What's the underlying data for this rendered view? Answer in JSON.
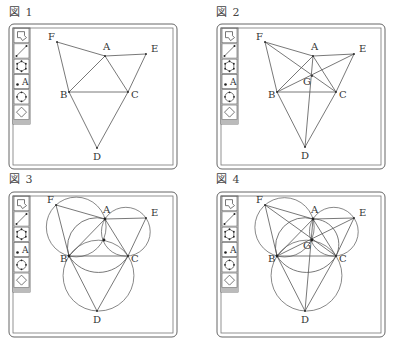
{
  "figures": [
    {
      "caption": "図 1",
      "points": {
        "F": [
          57,
          42
        ],
        "A": [
          105,
          56
        ],
        "E": [
          146,
          54
        ],
        "B": [
          69,
          92
        ],
        "C": [
          128,
          92
        ],
        "D": [
          97,
          148
        ]
      },
      "labels": [
        "F",
        "A",
        "E",
        "B",
        "C",
        "D"
      ],
      "segments": [
        [
          "F",
          "A"
        ],
        [
          "A",
          "E"
        ],
        [
          "F",
          "B"
        ],
        [
          "E",
          "C"
        ],
        [
          "A",
          "B"
        ],
        [
          "A",
          "C"
        ],
        [
          "B",
          "C"
        ],
        [
          "B",
          "D"
        ],
        [
          "C",
          "D"
        ]
      ],
      "circles": []
    },
    {
      "caption": "図 2",
      "points": {
        "F": [
          57,
          42
        ],
        "A": [
          105,
          56
        ],
        "E": [
          146,
          54
        ],
        "B": [
          69,
          92
        ],
        "C": [
          128,
          92
        ],
        "D": [
          97,
          147
        ],
        "G": [
          104,
          76
        ]
      },
      "labels": [
        "F",
        "A",
        "E",
        "B",
        "C",
        "D",
        "G"
      ],
      "segments": [
        [
          "F",
          "A"
        ],
        [
          "A",
          "E"
        ],
        [
          "F",
          "B"
        ],
        [
          "E",
          "C"
        ],
        [
          "A",
          "B"
        ],
        [
          "A",
          "C"
        ],
        [
          "B",
          "C"
        ],
        [
          "B",
          "D"
        ],
        [
          "C",
          "D"
        ],
        [
          "F",
          "C"
        ],
        [
          "E",
          "B"
        ],
        [
          "A",
          "D"
        ]
      ],
      "circles": []
    },
    {
      "caption": "図 3",
      "points": {
        "F": [
          56,
          37
        ],
        "A": [
          105,
          51
        ],
        "E": [
          146,
          50
        ],
        "B": [
          69,
          88
        ],
        "C": [
          128,
          88
        ],
        "D": [
          97,
          143
        ],
        "G": [
          104,
          72
        ]
      },
      "labels": [
        "F",
        "A",
        "E",
        "B",
        "C",
        "D"
      ],
      "segments": [
        [
          "F",
          "A"
        ],
        [
          "A",
          "E"
        ],
        [
          "F",
          "B"
        ],
        [
          "E",
          "C"
        ],
        [
          "A",
          "B"
        ],
        [
          "A",
          "C"
        ],
        [
          "B",
          "C"
        ],
        [
          "B",
          "D"
        ],
        [
          "C",
          "D"
        ]
      ],
      "circles": [
        {
          "through": [
            "A",
            "B",
            "F"
          ]
        },
        {
          "through": [
            "A",
            "C",
            "E"
          ]
        },
        {
          "through": [
            "B",
            "C",
            "D"
          ]
        }
      ],
      "arcs": [
        [
          "B",
          "G",
          "A"
        ],
        [
          "B",
          "G",
          "C"
        ]
      ]
    },
    {
      "caption": "図 4",
      "points": {
        "F": [
          57,
          37
        ],
        "A": [
          105,
          51
        ],
        "E": [
          146,
          50
        ],
        "B": [
          69,
          88
        ],
        "C": [
          128,
          88
        ],
        "D": [
          97,
          143
        ],
        "G": [
          104,
          72
        ]
      },
      "labels": [
        "F",
        "A",
        "E",
        "B",
        "C",
        "D",
        "G"
      ],
      "segments": [
        [
          "F",
          "A"
        ],
        [
          "A",
          "E"
        ],
        [
          "F",
          "B"
        ],
        [
          "E",
          "C"
        ],
        [
          "A",
          "B"
        ],
        [
          "A",
          "C"
        ],
        [
          "B",
          "C"
        ],
        [
          "B",
          "D"
        ],
        [
          "C",
          "D"
        ],
        [
          "F",
          "C"
        ],
        [
          "E",
          "B"
        ],
        [
          "A",
          "D"
        ]
      ],
      "circles": [
        {
          "through": [
            "A",
            "B",
            "F"
          ]
        },
        {
          "through": [
            "A",
            "C",
            "E"
          ]
        },
        {
          "through": [
            "B",
            "C",
            "D"
          ]
        }
      ],
      "arcs": [
        [
          "B",
          "G",
          "A"
        ],
        [
          "B",
          "G",
          "C"
        ],
        [
          "A",
          "G",
          "C"
        ]
      ]
    }
  ],
  "toolbar": {
    "tools": [
      {
        "name": "select-tool",
        "icon": "pointer-arrow-icon"
      },
      {
        "name": "segment-tool",
        "icon": "line-segment-icon"
      },
      {
        "name": "polygon-tool",
        "icon": "polygon-icon"
      },
      {
        "name": "point-label-tool",
        "icon": "point-label-icon",
        "text": "A"
      },
      {
        "name": "circle-tool",
        "icon": "circle-icon"
      },
      {
        "name": "transform-tool",
        "icon": "rhombus-icon"
      }
    ]
  }
}
